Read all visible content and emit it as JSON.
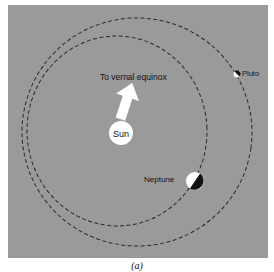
{
  "figure": {
    "caption": "(a)",
    "background_color": "#9a9a9a",
    "orbit_color": "#2a2a2a"
  },
  "labels": {
    "direction": "To vernal equinox",
    "sun": "Sun",
    "neptune": "Neptune",
    "pluto": "Pluto"
  },
  "objects": {
    "sun": {
      "cx": 121,
      "cy": 133,
      "r": 12,
      "color": "#ffffff"
    },
    "neptune": {
      "cx": 195,
      "cy": 181,
      "r": 9,
      "light": "#ffffff",
      "dark": "#111111"
    },
    "pluto": {
      "cx": 237,
      "cy": 74,
      "r": 3.5,
      "light": "#ffffff",
      "dark": "#111111"
    }
  },
  "orbits": {
    "neptune_orbit": {
      "cx": 117,
      "cy": 131,
      "rx": 90,
      "ry": 95,
      "style": "dashed"
    },
    "pluto_orbit": {
      "cx": 137,
      "cy": 132,
      "rx": 115,
      "ry": 114,
      "style": "dashed"
    }
  }
}
